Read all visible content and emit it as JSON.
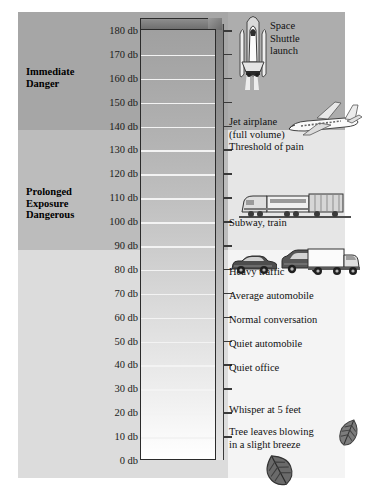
{
  "chart_data": {
    "type": "bar",
    "xlabel": "",
    "ylabel": "db",
    "ylim": [
      0,
      180
    ],
    "grid": true,
    "legend_position": "none",
    "axis_unit": "db",
    "tick_step": 10,
    "categories": [
      "0 db",
      "10 db",
      "20 db",
      "30 db",
      "40 db",
      "50 db",
      "60 db",
      "70 db",
      "80 db",
      "90 db",
      "100 db",
      "110 db",
      "120 db",
      "130 db",
      "140 db",
      "150 db",
      "160 db",
      "170 db",
      "180 db"
    ],
    "values": [
      0,
      10,
      20,
      30,
      40,
      50,
      60,
      70,
      80,
      90,
      100,
      110,
      120,
      130,
      140,
      150,
      160,
      170,
      180
    ],
    "annotations": [
      {
        "db": 180,
        "text": "Space Shuttle launch"
      },
      {
        "db": 140,
        "text": "Jet airplane (full volume)"
      },
      {
        "db": 130,
        "text": "Threshold of pain"
      },
      {
        "db": 100,
        "text": "Subway, train"
      },
      {
        "db": 80,
        "text": "Heavy traffic"
      },
      {
        "db": 70,
        "text": "Average automobile"
      },
      {
        "db": 60,
        "text": "Normal conversation"
      },
      {
        "db": 50,
        "text": "Quiet automobile"
      },
      {
        "db": 40,
        "text": "Quiet office"
      },
      {
        "db": 20,
        "text": "Whisper at 5 feet"
      },
      {
        "db": 15,
        "text": "Tree leaves blowing in a slight breeze"
      }
    ],
    "zones": [
      {
        "label": "Immediate Danger",
        "db_range": [
          130,
          180
        ]
      },
      {
        "label": "Prolonged Exposure Dangerous",
        "db_range": [
          90,
          130
        ]
      },
      {
        "label": "Safe",
        "db_range": [
          0,
          90
        ]
      }
    ]
  },
  "scale": {
    "ticks": [
      {
        "label": "180 db"
      },
      {
        "label": "170 db"
      },
      {
        "label": "160 db"
      },
      {
        "label": "150 db"
      },
      {
        "label": "140 db"
      },
      {
        "label": "130 db"
      },
      {
        "label": "120 db"
      },
      {
        "label": "110 db"
      },
      {
        "label": "100 db"
      },
      {
        "label": "90 db"
      },
      {
        "label": "80 db"
      },
      {
        "label": "70 db"
      },
      {
        "label": "60 db"
      },
      {
        "label": "50 db"
      },
      {
        "label": "40 db"
      },
      {
        "label": "30 db"
      },
      {
        "label": "20 db"
      },
      {
        "label": "10 db"
      },
      {
        "label": "0 db"
      }
    ]
  },
  "zones": {
    "immediate": {
      "line1": "Immediate",
      "line2": "Danger"
    },
    "prolonged": {
      "line1": "Prolonged",
      "line2": "Exposure",
      "line3": "Dangerous"
    }
  },
  "sources": {
    "shuttle": {
      "line1": "Space",
      "line2": "Shuttle",
      "line3": "launch"
    },
    "jet": {
      "line1": "Jet airplane",
      "line2": "(full volume)"
    },
    "pain": {
      "line1": "Threshold of pain"
    },
    "subway": {
      "line1": "Subway, train"
    },
    "traffic": {
      "line1": "Heavy traffic"
    },
    "auto": {
      "line1": "Average automobile"
    },
    "convo": {
      "line1": "Normal conversation"
    },
    "quietauto": {
      "line1": "Quiet automobile"
    },
    "office": {
      "line1": "Quiet office"
    },
    "whisper": {
      "line1": "Whisper at 5 feet"
    },
    "leaves": {
      "line1": "Tree leaves blowing",
      "line2": "in a slight breeze"
    }
  },
  "icons": {
    "shuttle": "space-shuttle-icon",
    "jet": "jet-airplane-icon",
    "train": "subway-train-icon",
    "car": "car-icon",
    "van": "van-icon",
    "truck": "truck-icon",
    "leaf_small": "leaf-icon",
    "leaf_large": "leaf-icon"
  },
  "colors": {
    "zone_immediate": "#a6a6a6",
    "zone_prolonged": "#bcbcbc",
    "zone_safe": "#dcdcdc",
    "column_outline": "#2b2b2b",
    "gridline": "#f3f3f3",
    "text": "#111111"
  }
}
